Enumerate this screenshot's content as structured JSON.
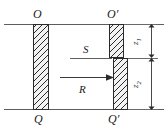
{
  "figure": {
    "type": "engineering-section-diagram",
    "background_color": "#ffffff",
    "line_color": "#5d5d5d",
    "hatch_color": "#2b2b2b",
    "text_color": "#1a1a1a"
  },
  "labels": {
    "top_left": "O",
    "top_right": "O′",
    "bottom_left": "Q",
    "bottom_right": "Q′",
    "flow_surface": "S",
    "flow_arrow": "R"
  },
  "dimensions": [
    {
      "name": "z1",
      "symbol": "z",
      "subscript": "1",
      "span": "O′ to S"
    },
    {
      "name": "z2",
      "symbol": "z",
      "subscript": "2",
      "span": "S to Q′"
    }
  ],
  "elements": {
    "line_top": "upper boundary line",
    "line_bottom": "lower boundary line",
    "bar_left": "left hatched column O-Q",
    "bar_right_upper": "right hatched column upper segment O′-S",
    "bar_right_lower": "right hatched column lower segment S-Q′",
    "line_s": "horizontal S level line",
    "arrow_r": "rightward flow arrow R"
  }
}
